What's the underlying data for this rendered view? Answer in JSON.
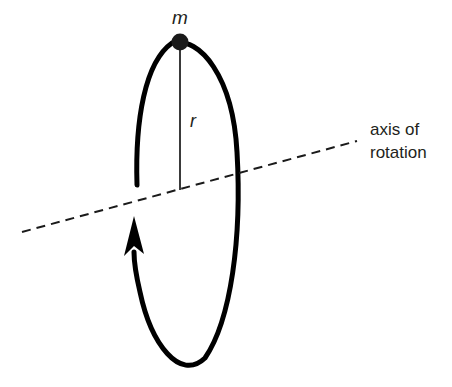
{
  "canvas": {
    "width": 452,
    "height": 387,
    "background": "#ffffff"
  },
  "colors": {
    "stroke": "#000000",
    "ink": "#231f20",
    "radius_line": "#3a3a3a",
    "dashed_axis": "#1a1a1a"
  },
  "labels": {
    "mass": "m",
    "radius": "r",
    "axis_line_1": "axis of",
    "axis_line_2": "rotation"
  },
  "geometry": {
    "ellipse": {
      "cx": 187,
      "cy": 204,
      "rx": 51,
      "ry": 164,
      "stroke_width": 5
    },
    "mass_dot": {
      "cx": 180,
      "cy": 42,
      "r": 8
    },
    "radius_line": {
      "x1": 180,
      "y1": 44,
      "x2": 180,
      "y2": 190,
      "stroke_width": 2
    },
    "dashed_axis": {
      "x1": 22,
      "y1": 232,
      "x2": 357,
      "y2": 141,
      "stroke_width": 2,
      "dash": "9 6"
    },
    "rotation_arrow": {
      "tip_x": 134,
      "tip_y": 216,
      "base_y": 252,
      "half_width": 9
    },
    "label_positions": {
      "mass": {
        "x": 180,
        "y": 24
      },
      "radius": {
        "x": 190,
        "y": 127
      },
      "axis_line_1": {
        "x": 370,
        "y": 135
      },
      "axis_line_2": {
        "x": 370,
        "y": 158
      }
    }
  }
}
